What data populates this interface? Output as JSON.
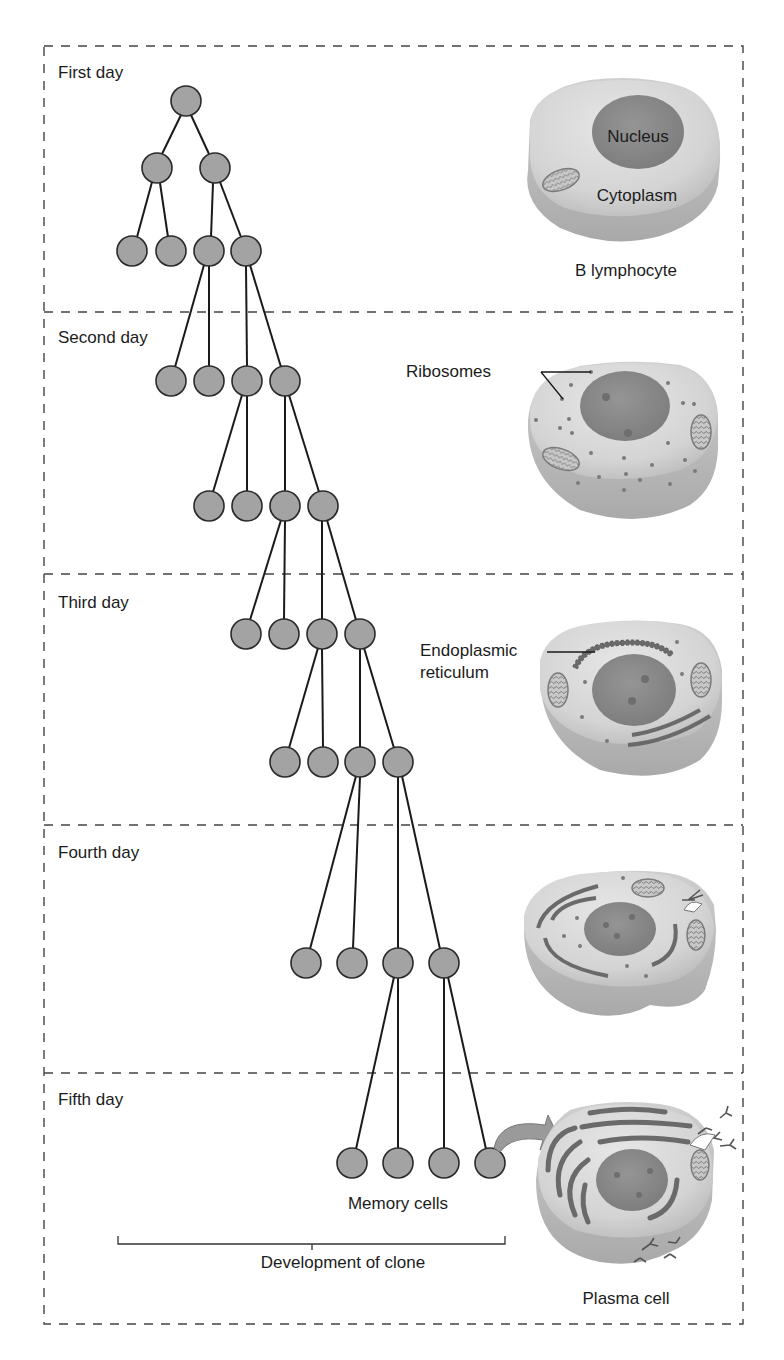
{
  "diagram": {
    "title": "Development of clone",
    "days": [
      {
        "label": "First day"
      },
      {
        "label": "Second day"
      },
      {
        "label": "Third day"
      },
      {
        "label": "Fourth day"
      },
      {
        "label": "Fifth day"
      }
    ],
    "cells": {
      "b_lymphocyte": {
        "caption": "B lymphocyte",
        "nucleus_label": "Nucleus",
        "cytoplasm_label": "Cytoplasm"
      },
      "day2": {
        "callout": "Ribosomes"
      },
      "day3": {
        "callout_line1": "Endoplasmic",
        "callout_line2": "reticulum"
      },
      "plasma_cell": {
        "caption": "Plasma cell"
      }
    },
    "memory_cells_label": "Memory cells",
    "bracket_label": "Development of clone",
    "colors": {
      "node_fill": "#a3a3a3",
      "node_stroke": "#2a2a2a",
      "cell_body": "#d9d9d9",
      "cell_shadow": "#bdbdbd",
      "nucleus": "#8c8c8c",
      "er": "#6f6f6f",
      "border_dash": "#444444"
    }
  }
}
